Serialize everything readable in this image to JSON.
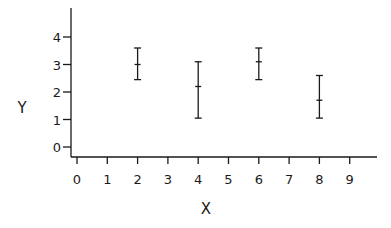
{
  "chart_data": {
    "type": "scatter",
    "subtype": "error-bar",
    "title": "",
    "xlabel": "X",
    "ylabel": "Y",
    "xlim": [
      0,
      10
    ],
    "ylim": [
      0,
      4.5
    ],
    "x_ticks": [
      "0",
      "1",
      "2",
      "3",
      "4",
      "5",
      "6",
      "7",
      "8",
      "9"
    ],
    "y_ticks": [
      "0",
      "1",
      "2",
      "3",
      "4"
    ],
    "grid": false,
    "legend": null,
    "points": [
      {
        "x": 2,
        "y": 3.0,
        "low": 2.45,
        "high": 3.6
      },
      {
        "x": 4,
        "y": 2.2,
        "low": 1.05,
        "high": 3.1
      },
      {
        "x": 6,
        "y": 3.1,
        "low": 2.45,
        "high": 3.6
      },
      {
        "x": 8,
        "y": 1.7,
        "low": 1.05,
        "high": 2.6
      }
    ],
    "color": "#1a1a1a"
  }
}
